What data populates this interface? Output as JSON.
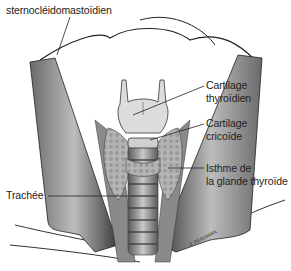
{
  "figure": {
    "type": "anatomical-illustration"
  },
  "labels": {
    "muscle": "sternocléidomastoïdien",
    "cartilage_thyroid_line1": "Cartilage",
    "cartilage_thyroid_line2": "thyroïdien",
    "cartilage_cricoid_line1": "Cartilage",
    "cartilage_cricoid_line2": "cricoïde",
    "isthmus_line1": "Isthme de",
    "isthmus_line2": "la glande thyroïde",
    "trachea": "Trachée"
  },
  "signature": "F. FERDMAN",
  "colors": {
    "background": "#ffffff",
    "ink": "#222222",
    "muscle_dark": "#3a3a3a",
    "muscle_light": "#9a9a9a",
    "cartilage": "#d9d9d9",
    "gland": "#a8a8a8"
  }
}
